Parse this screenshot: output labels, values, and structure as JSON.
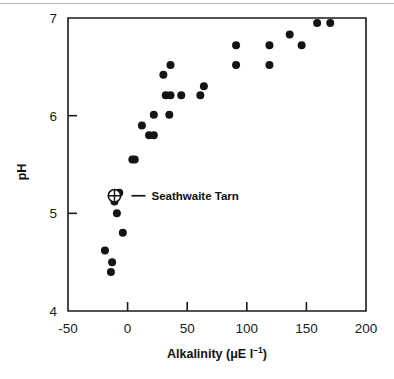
{
  "chart_data": {
    "type": "scatter",
    "title": "",
    "xlabel": "Alkalinity (μE l⁻¹)",
    "xlabel_main": "Alkalinity (μE l",
    "xlabel_sup": "−1",
    "xlabel_tail": ")",
    "ylabel": "pH",
    "xlim": [
      -50,
      200
    ],
    "ylim": [
      4,
      7
    ],
    "xticks": [
      -50,
      0,
      50,
      100,
      150,
      200
    ],
    "xtick_labels": [
      "-50",
      "0",
      "50",
      "100",
      "150",
      "200"
    ],
    "yticks": [
      4,
      5,
      6,
      7
    ],
    "ytick_labels": [
      "4",
      "5",
      "6",
      "7"
    ],
    "grid": false,
    "legend": "none",
    "marker_color": "#141414",
    "axis_color": "#1a1a1a",
    "background": "#ffffff",
    "series": [
      {
        "name": "Lake samples",
        "marker": "filled-circle",
        "points": [
          [
            -19,
            4.62
          ],
          [
            -13,
            4.5
          ],
          [
            -14,
            4.4
          ],
          [
            -9,
            5.0
          ],
          [
            -11,
            5.12
          ],
          [
            -10,
            5.2
          ],
          [
            -7,
            5.21
          ],
          [
            -4,
            4.8
          ],
          [
            4,
            5.55
          ],
          [
            6,
            5.55
          ],
          [
            12,
            5.9
          ],
          [
            18,
            5.8
          ],
          [
            22,
            5.8
          ],
          [
            22,
            6.01
          ],
          [
            35,
            6.01
          ],
          [
            30,
            6.42
          ],
          [
            36,
            6.52
          ],
          [
            32,
            6.21
          ],
          [
            36,
            6.21
          ],
          [
            45,
            6.21
          ],
          [
            61,
            6.21
          ],
          [
            64,
            6.3
          ],
          [
            91,
            6.52
          ],
          [
            91,
            6.72
          ],
          [
            119,
            6.52
          ],
          [
            119,
            6.72
          ],
          [
            136,
            6.83
          ],
          [
            146,
            6.72
          ],
          [
            159,
            6.95
          ],
          [
            170,
            6.95
          ]
        ]
      },
      {
        "name": "Seathwaite Tarn",
        "marker": "crossed-circle",
        "points": [
          [
            -11,
            5.18
          ]
        ]
      }
    ],
    "annotations": [
      {
        "text": "Seathwaite Tarn",
        "target": [
          -11,
          5.18
        ],
        "leader": true
      }
    ]
  },
  "figure": {
    "annotation_label": "Seathwaite Tarn"
  }
}
